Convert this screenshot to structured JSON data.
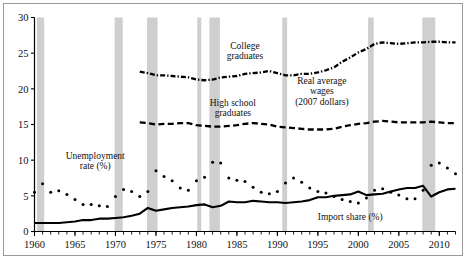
{
  "chart_data": {
    "type": "line",
    "title": "",
    "xlabel": "",
    "ylabel": "",
    "xlim": [
      1960,
      2012
    ],
    "ylim": [
      0,
      30
    ],
    "grid": false,
    "legend_position": "inline-annotations",
    "y_ticks": [
      "0",
      "5",
      "10",
      "15",
      "20",
      "25",
      "30"
    ],
    "y_tick_values": [
      0,
      5,
      10,
      15,
      20,
      25,
      30
    ],
    "x_ticks": [
      "1960",
      "1965",
      "1970",
      "1975",
      "1980",
      "1985",
      "1990",
      "1995",
      "2000",
      "2005",
      "2010"
    ],
    "x_tick_values": [
      1960,
      1965,
      1970,
      1975,
      1980,
      1985,
      1990,
      1995,
      2000,
      2005,
      2010
    ],
    "x_minor_tick_step": 1,
    "annotations": [
      {
        "name": "college-graduates-label",
        "text": "College\ngraduates",
        "line1": "College",
        "line2": "graduates",
        "x": 1986,
        "y": 25.6
      },
      {
        "name": "high-school-graduates-label",
        "text": "High school\ngraduates",
        "line1": "High school",
        "line2": "graduates",
        "x": 1984.5,
        "y": 17.6
      },
      {
        "name": "real-average-wages-label",
        "text": "Real average\nwages\n(2007 dollars)",
        "line1": "Real average",
        "line2": "wages",
        "line3": "(2007 dollars)",
        "x": 1995.5,
        "y": 20.7
      },
      {
        "name": "unemployment-rate-label",
        "text": "Unemployment\nrate (%)",
        "line1": "Unemployment",
        "line2": "rate (%)",
        "x": 1967.5,
        "y": 10.2
      },
      {
        "name": "import-share-label",
        "text": "Import share (%)",
        "line1": "Import share (%)",
        "x": 1999.0,
        "y": 1.55
      }
    ],
    "recession_bands": [
      {
        "start": 1960.3,
        "end": 1961.2
      },
      {
        "start": 1969.9,
        "end": 1970.9
      },
      {
        "start": 1973.9,
        "end": 1975.2
      },
      {
        "start": 1980.1,
        "end": 1980.6
      },
      {
        "start": 1981.6,
        "end": 1982.9
      },
      {
        "start": 1990.6,
        "end": 1991.2
      },
      {
        "start": 2001.2,
        "end": 2001.9
      },
      {
        "start": 2007.9,
        "end": 2009.5
      }
    ],
    "recession_band_color": "#cfcfcf",
    "series": [
      {
        "name": "College graduates",
        "style": "dash-dot",
        "color": "#000000",
        "x": [
          1973,
          1974,
          1975,
          1976,
          1977,
          1978,
          1979,
          1980,
          1981,
          1982,
          1983,
          1984,
          1985,
          1986,
          1987,
          1988,
          1989,
          1990,
          1991,
          1992,
          1993,
          1994,
          1995,
          1996,
          1997,
          1998,
          1999,
          2000,
          2001,
          2002,
          2003,
          2004,
          2005,
          2006,
          2007,
          2008,
          2009,
          2010,
          2011,
          2012
        ],
        "values": [
          22.4,
          22.2,
          21.9,
          21.9,
          21.8,
          21.7,
          21.6,
          21.3,
          21.2,
          21.3,
          21.6,
          21.7,
          21.8,
          22.1,
          22.2,
          22.3,
          22.5,
          22.2,
          21.9,
          21.9,
          22.1,
          22.1,
          22.3,
          22.6,
          23.0,
          23.8,
          24.4,
          25.1,
          25.6,
          26.3,
          26.5,
          26.4,
          26.3,
          26.4,
          26.5,
          26.5,
          26.6,
          26.6,
          26.5,
          26.5
        ]
      },
      {
        "name": "High school graduates",
        "style": "dashed",
        "color": "#000000",
        "x": [
          1973,
          1974,
          1975,
          1976,
          1977,
          1978,
          1979,
          1980,
          1981,
          1982,
          1983,
          1984,
          1985,
          1986,
          1987,
          1988,
          1989,
          1990,
          1991,
          1992,
          1993,
          1994,
          1995,
          1996,
          1997,
          1998,
          1999,
          2000,
          2001,
          2002,
          2003,
          2004,
          2005,
          2006,
          2007,
          2008,
          2009,
          2010,
          2011,
          2012
        ],
        "values": [
          15.3,
          15.2,
          15.0,
          15.1,
          15.1,
          15.2,
          15.2,
          14.9,
          14.8,
          14.7,
          14.7,
          14.8,
          14.9,
          15.1,
          15.2,
          15.1,
          15.0,
          14.7,
          14.6,
          14.5,
          14.4,
          14.3,
          14.3,
          14.3,
          14.4,
          14.7,
          14.9,
          15.1,
          15.2,
          15.4,
          15.5,
          15.4,
          15.3,
          15.3,
          15.3,
          15.3,
          15.4,
          15.3,
          15.2,
          15.2
        ]
      },
      {
        "name": "Unemployment rate (%)",
        "style": "dotted",
        "color": "#000000",
        "x": [
          1960,
          1961,
          1962,
          1963,
          1964,
          1965,
          1966,
          1967,
          1968,
          1969,
          1970,
          1971,
          1972,
          1973,
          1974,
          1975,
          1976,
          1977,
          1978,
          1979,
          1980,
          1981,
          1982,
          1983,
          1984,
          1985,
          1986,
          1987,
          1988,
          1989,
          1990,
          1991,
          1992,
          1993,
          1994,
          1995,
          1996,
          1997,
          1998,
          1999,
          2000,
          2001,
          2002,
          2003,
          2004,
          2005,
          2006,
          2007,
          2008,
          2009,
          2010,
          2011,
          2012
        ],
        "values": [
          5.5,
          6.7,
          5.5,
          5.7,
          5.2,
          4.5,
          3.8,
          3.8,
          3.6,
          3.5,
          4.9,
          5.9,
          5.6,
          4.9,
          5.6,
          8.5,
          7.7,
          7.1,
          6.1,
          5.8,
          7.1,
          7.6,
          9.7,
          9.6,
          7.5,
          7.2,
          7.0,
          6.2,
          5.5,
          5.3,
          5.6,
          6.8,
          7.5,
          6.9,
          6.1,
          5.6,
          5.4,
          4.9,
          4.5,
          4.2,
          4.0,
          4.7,
          5.8,
          6.0,
          5.5,
          5.1,
          4.6,
          4.6,
          5.8,
          9.3,
          9.6,
          8.9,
          8.1
        ]
      },
      {
        "name": "Import share (%)",
        "style": "solid",
        "color": "#000000",
        "x": [
          1960,
          1961,
          1962,
          1963,
          1964,
          1965,
          1966,
          1967,
          1968,
          1969,
          1970,
          1971,
          1972,
          1973,
          1974,
          1975,
          1976,
          1977,
          1978,
          1979,
          1980,
          1981,
          1982,
          1983,
          1984,
          1985,
          1986,
          1987,
          1988,
          1989,
          1990,
          1991,
          1992,
          1993,
          1994,
          1995,
          1996,
          1997,
          1998,
          1999,
          2000,
          2001,
          2002,
          2003,
          2004,
          2005,
          2006,
          2007,
          2008,
          2009,
          2010,
          2011,
          2012
        ],
        "values": [
          1.2,
          1.2,
          1.2,
          1.2,
          1.3,
          1.4,
          1.6,
          1.6,
          1.8,
          1.8,
          1.9,
          2.0,
          2.2,
          2.5,
          3.3,
          2.9,
          3.1,
          3.3,
          3.4,
          3.5,
          3.7,
          3.8,
          3.4,
          3.6,
          4.2,
          4.1,
          4.1,
          4.3,
          4.2,
          4.1,
          4.1,
          4.0,
          4.1,
          4.2,
          4.4,
          4.8,
          4.8,
          5.0,
          5.1,
          5.2,
          5.6,
          5.1,
          5.2,
          5.3,
          5.6,
          5.9,
          6.1,
          6.1,
          6.4,
          4.9,
          5.5,
          5.9,
          6.0
        ]
      }
    ]
  }
}
